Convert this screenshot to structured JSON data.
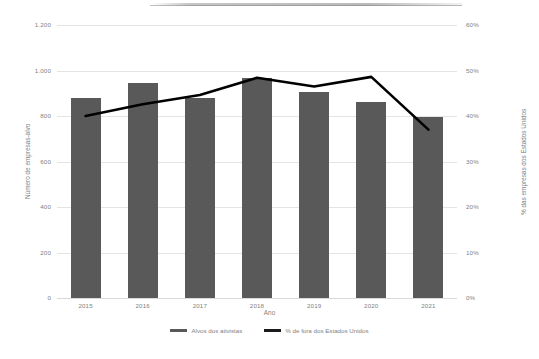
{
  "chart_data": {
    "type": "bar",
    "title": "",
    "subtitle": "",
    "xlabel": "Ano",
    "ylabel": "Número de empresas-alvo",
    "y2label": "% das empresas dos Estados Unidos",
    "categories": [
      "2015",
      "2016",
      "2017",
      "2018",
      "2019",
      "2020",
      "2021"
    ],
    "ylim": [
      0,
      1200
    ],
    "y2lim": [
      0,
      60
    ],
    "yticks": [
      "0",
      "200",
      "400",
      "600",
      "800",
      "1.000",
      "1.200"
    ],
    "ytick_values": [
      0,
      200,
      400,
      600,
      800,
      1000,
      1200
    ],
    "y2ticks": [
      "0%",
      "10%",
      "20%",
      "30%",
      "40%",
      "50%",
      "60%"
    ],
    "y2tick_values": [
      0,
      10,
      20,
      30,
      40,
      50,
      60
    ],
    "grid": true,
    "legend_position": "bottom",
    "series": [
      {
        "name": "Alvos dos ativistas",
        "type": "bar",
        "axis": "left",
        "color": "#595959",
        "values": [
          880,
          945,
          880,
          968,
          906,
          862,
          796
        ]
      },
      {
        "name": "% de fora dos Estados Unidos",
        "type": "line",
        "axis": "right",
        "color": "#000000",
        "values": [
          40.0,
          42.6,
          44.6,
          48.4,
          46.5,
          48.6,
          37.0
        ]
      }
    ]
  },
  "legend": {
    "items": [
      {
        "label": "Alvos dos ativistas",
        "color": "#595959"
      },
      {
        "label": "% de fora dos Estados Unidos",
        "color": "#1a1a1a"
      }
    ]
  },
  "axes": {
    "x_title": "Ano",
    "y_left_title": "Número de empresas-alvo",
    "y_right_title": "% das empresas dos Estados Unidos"
  }
}
